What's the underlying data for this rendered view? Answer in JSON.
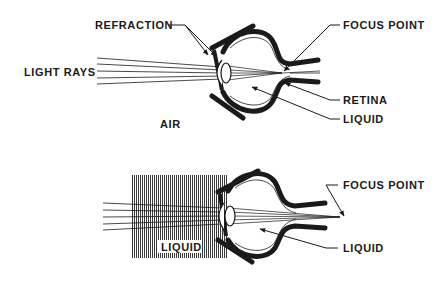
{
  "diagram": {
    "top": {
      "labels": {
        "refraction": "REFRACTION",
        "light_rays": "LIGHT RAYS",
        "air": "AIR",
        "focus_point": "FOCUS POINT",
        "retina": "RETINA",
        "liquid": "LIQUID"
      }
    },
    "bottom": {
      "labels": {
        "liquid_box": "LIQUID",
        "focus_point": "FOCUS POINT",
        "liquid": "LIQUID"
      }
    },
    "colors": {
      "ink": "#1a1a1a",
      "background": "#ffffff",
      "liquid_hatch": "#555555"
    }
  }
}
